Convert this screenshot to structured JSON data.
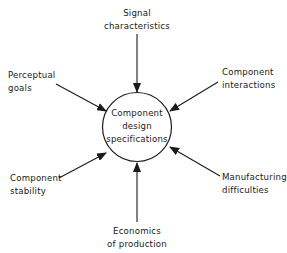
{
  "diagram": {
    "center_node": {
      "lines": [
        "Component",
        "design",
        "specifications"
      ]
    },
    "inputs": [
      {
        "id": "signal",
        "lines": [
          "Signal",
          "characteristics"
        ]
      },
      {
        "id": "perceptual",
        "lines": [
          "Perceptual",
          "goals"
        ]
      },
      {
        "id": "interactions",
        "lines": [
          "Component",
          "interactions"
        ]
      },
      {
        "id": "stability",
        "lines": [
          "Component",
          "stability"
        ]
      },
      {
        "id": "manufacturing",
        "lines": [
          "Manufacturing",
          "difficulties"
        ]
      },
      {
        "id": "economics",
        "lines": [
          "Economics",
          "of production"
        ]
      }
    ],
    "colors": {
      "stroke": "#1a1a1a",
      "background": "#ffffff"
    }
  }
}
